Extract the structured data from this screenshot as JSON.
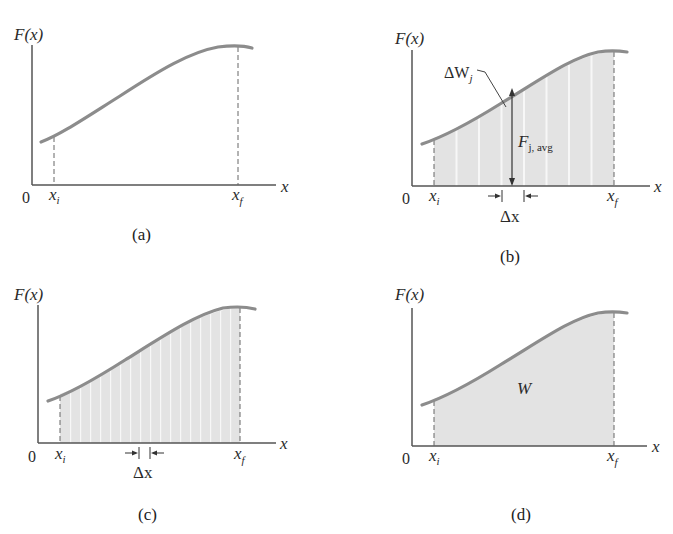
{
  "figure": {
    "colors": {
      "curve": "#8c8c8c",
      "axis": "#555555",
      "fill": "#e3e3e3",
      "strip_gap": "#f7f7f7",
      "text": "#222222"
    },
    "panels": [
      {
        "id": "a",
        "caption": "(a)",
        "y_axis_label": "F(x)",
        "x_axis_label": "x",
        "origin_label": "0",
        "xi_label": "x",
        "xi_sub": "i",
        "xf_label": "x",
        "xf_sub": "f",
        "shading": "none"
      },
      {
        "id": "b",
        "caption": "(b)",
        "y_axis_label": "F(x)",
        "x_axis_label": "x",
        "origin_label": "0",
        "xi_label": "x",
        "xi_sub": "i",
        "xf_label": "x",
        "xf_sub": "f",
        "shading": "wide-strips",
        "strip_count": 8,
        "annot_dw": "ΔW",
        "annot_dw_sub": "j",
        "annot_favg": "F",
        "annot_favg_sub": "j, avg",
        "annot_dx": "Δx"
      },
      {
        "id": "c",
        "caption": "(c)",
        "y_axis_label": "F(x)",
        "x_axis_label": "x",
        "origin_label": "0",
        "xi_label": "x",
        "xi_sub": "i",
        "xf_label": "x",
        "xf_sub": "f",
        "shading": "narrow-strips",
        "strip_count": 18,
        "annot_dx": "Δx"
      },
      {
        "id": "d",
        "caption": "(d)",
        "y_axis_label": "F(x)",
        "x_axis_label": "x",
        "origin_label": "0",
        "xi_label": "x",
        "xi_sub": "i",
        "xf_label": "x",
        "xf_sub": "f",
        "shading": "continuous",
        "annot_area": "W"
      }
    ]
  }
}
